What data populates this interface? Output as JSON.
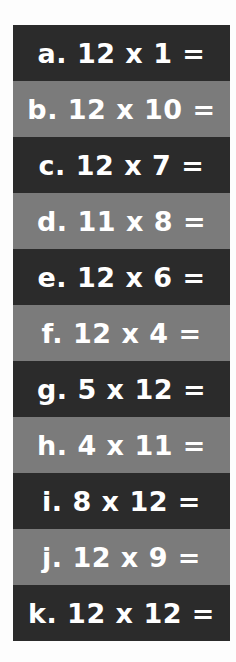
{
  "colors": {
    "dark": "#2b2b2b",
    "light": "#7b7b7b",
    "text": "#ffffff"
  },
  "problems": [
    {
      "label": "a. 12 x 1 ="
    },
    {
      "label": "b. 12 x 10 ="
    },
    {
      "label": "c. 12 x 7 ="
    },
    {
      "label": "d. 11 x 8 ="
    },
    {
      "label": "e. 12 x 6 ="
    },
    {
      "label": "f. 12 x 4 ="
    },
    {
      "label": "g. 5 x 12 ="
    },
    {
      "label": "h. 4 x 11 ="
    },
    {
      "label": "i. 8 x 12 ="
    },
    {
      "label": "j. 12 x 9 ="
    },
    {
      "label": "k. 12 x 12 ="
    }
  ]
}
